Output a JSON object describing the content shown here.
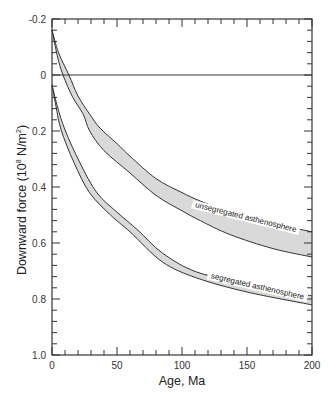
{
  "chart_data": {
    "type": "area",
    "title": "",
    "xlabel": "Age, Ma",
    "ylabel": "Downward force (10⁸ N/m²)",
    "ylabel_parts": {
      "main": "Downward force (10",
      "sup1": "8",
      "mid": " N/m",
      "sup2": "2",
      "end": ")"
    },
    "xlim": [
      0,
      200
    ],
    "ylim": [
      -0.2,
      1.0
    ],
    "y_inverted": true,
    "grid": false,
    "x_ticks": [
      0,
      50,
      100,
      150,
      200
    ],
    "x_tick_labels": [
      "0",
      "50",
      "100",
      "150",
      "200"
    ],
    "y_ticks": [
      -0.2,
      0,
      0.2,
      0.4,
      0.6,
      0.8,
      1.0
    ],
    "y_tick_labels": [
      "-0.2",
      "0",
      "0.2",
      "0.4",
      "0.6",
      "0.8",
      "1.0"
    ],
    "reference_line": {
      "y": 0
    },
    "series": [
      {
        "name": "unsegregated asthenosphere",
        "fill": "#d9d9d9",
        "upper": {
          "x": [
            0,
            5,
            13,
            20,
            29,
            37,
            50,
            60,
            80,
            100,
            114,
            137,
            170,
            200
          ],
          "y": [
            -0.16,
            -0.08,
            0,
            0.075,
            0.14,
            0.19,
            0.245,
            0.29,
            0.37,
            0.42,
            0.45,
            0.49,
            0.53,
            0.56
          ]
        },
        "lower": {
          "x": [
            0,
            4,
            8.5,
            16,
            24,
            29,
            40,
            60,
            80,
            100,
            114,
            137,
            170,
            200
          ],
          "y": [
            -0.16,
            -0.07,
            0,
            0.08,
            0.14,
            0.2,
            0.27,
            0.35,
            0.43,
            0.485,
            0.52,
            0.57,
            0.62,
            0.65
          ]
        }
      },
      {
        "name": "segregated asthenosphere",
        "fill": "#d9d9d9",
        "upper": {
          "x": [
            0,
            4,
            10,
            21.5,
            34.6,
            50,
            66,
            85,
            111.5,
            150,
            200
          ],
          "y": [
            0.035,
            0.11,
            0.196,
            0.314,
            0.421,
            0.49,
            0.554,
            0.636,
            0.704,
            0.743,
            0.789
          ]
        },
        "lower": {
          "x": [
            0,
            3,
            7,
            17,
            29,
            45,
            60,
            85,
            111.5,
            150,
            200
          ],
          "y": [
            0.035,
            0.11,
            0.196,
            0.314,
            0.421,
            0.5,
            0.56,
            0.668,
            0.725,
            0.775,
            0.821
          ]
        }
      }
    ],
    "annotations": [
      {
        "text": "unsegregated asthenosphere",
        "x": 118,
        "y": 0.515,
        "angle": 14
      },
      {
        "text": "segregated asthenosphere",
        "x": 127,
        "y": 0.762,
        "angle": 13
      }
    ]
  }
}
